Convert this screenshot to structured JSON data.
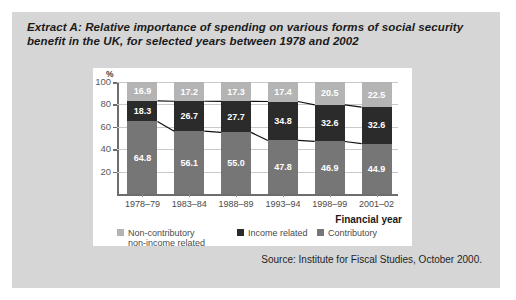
{
  "extract": {
    "title": "Extract A: Relative importance of spending on various forms of social security benefit in the UK, for selected years between 1978 and 2002",
    "source": "Source: Institute for Fiscal Studies, October 2000."
  },
  "colors": {
    "panel_background": "#d6d6d6",
    "card_background": "#ffffff",
    "non_contributory": "#b4b4b4",
    "income_related": "#2b2b2b",
    "contributory": "#767676",
    "axis": "#6d6d6d",
    "gridline": "#c9c9c9"
  },
  "chart_data": {
    "type": "bar",
    "stacked": true,
    "title": "",
    "xlabel": "Financial year",
    "ylabel": "%",
    "ylim": [
      0,
      100
    ],
    "yticks": [
      20,
      40,
      60,
      80,
      100
    ],
    "grid": true,
    "legend_position": "bottom",
    "categories": [
      "1978–79",
      "1983–84",
      "1988–89",
      "1993–94",
      "1998–99",
      "2001–02"
    ],
    "series": [
      {
        "name": "Contributory",
        "color": "#767676",
        "values": [
          64.8,
          56.1,
          55.0,
          47.8,
          46.9,
          44.9
        ]
      },
      {
        "name": "Income related",
        "color": "#2b2b2b",
        "values": [
          18.3,
          26.7,
          27.7,
          34.8,
          32.6,
          32.6
        ]
      },
      {
        "name": "Non-contributory non-income related",
        "color": "#b4b4b4",
        "values": [
          16.9,
          17.2,
          17.3,
          17.4,
          20.5,
          22.5
        ]
      }
    ],
    "legend": [
      {
        "label_line1": "Non-contributory",
        "label_line2": "non-income related",
        "color": "#b4b4b4"
      },
      {
        "label_line1": "Income related",
        "label_line2": "",
        "color": "#2b2b2b"
      },
      {
        "label_line1": "Contributory",
        "label_line2": "",
        "color": "#767676"
      }
    ]
  }
}
